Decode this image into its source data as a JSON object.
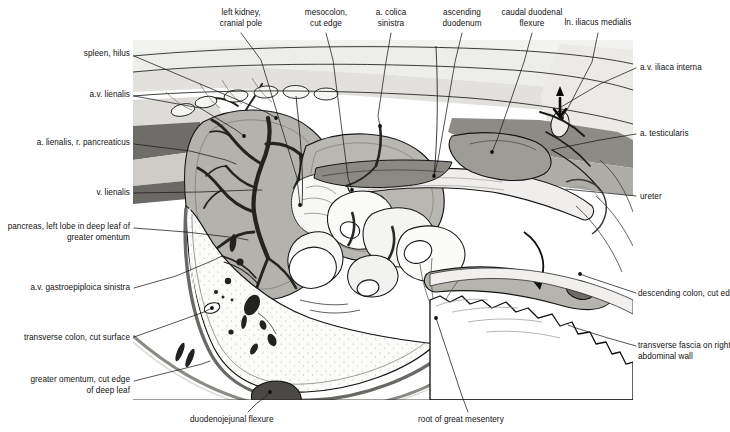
{
  "plate": {
    "title": "Abdominal cavity, left lateral view",
    "domain": "anatomical-illustration",
    "medium": "grayscale line-and-tone drawing",
    "canvas": {
      "width": 730,
      "height": 432
    },
    "artwork_frame": {
      "x": 133,
      "y": 40,
      "width": 500,
      "height": 360
    }
  },
  "palette": {
    "page_background": "#ffffff",
    "label_text": "#121212",
    "leader_line": "#1a1a1a",
    "outline": "#111111",
    "tone_lightest": "#f4f4f2",
    "tone_light": "#e6e5e2",
    "tone_mid_light": "#cfcdc9",
    "tone_mid": "#b2b0ab",
    "tone_mid_dark": "#8e8c87",
    "tone_dark": "#5d5b57",
    "tone_darkest": "#2e2d2b"
  },
  "labels": [
    {
      "id": "left-kidney-cranial-pole",
      "text": "left kidney,\ncranial pole",
      "align": "center",
      "x": 198,
      "y": 8,
      "width": 86,
      "leader": [
        [
          241,
          33
        ],
        [
          261,
          60
        ],
        [
          297,
          178
        ],
        [
          300,
          205
        ]
      ]
    },
    {
      "id": "mesocolon-cut-edge",
      "text": "mesocolon,\ncut edge",
      "align": "center",
      "x": 288,
      "y": 8,
      "width": 76,
      "leader": [
        [
          326,
          33
        ],
        [
          333,
          60
        ],
        [
          348,
          178
        ],
        [
          352,
          190
        ]
      ]
    },
    {
      "id": "a-colica-sinistra",
      "text": "a. colica\nsinistra",
      "align": "center",
      "x": 360,
      "y": 8,
      "width": 62,
      "leader": [
        [
          391,
          33
        ],
        [
          386,
          62
        ],
        [
          378,
          116
        ],
        [
          380,
          126
        ]
      ]
    },
    {
      "id": "ascending-duodenum",
      "text": "ascending\nduodenum",
      "align": "center",
      "x": 425,
      "y": 8,
      "width": 74,
      "leader": [
        [
          462,
          33
        ],
        [
          455,
          62
        ],
        [
          438,
          160
        ],
        [
          434,
          176
        ]
      ]
    },
    {
      "id": "caudal-duodenal-flexure",
      "text": "caudal duodenal\nflexure",
      "align": "center",
      "x": 480,
      "y": 8,
      "width": 104,
      "leader": [
        [
          532,
          33
        ],
        [
          524,
          62
        ],
        [
          497,
          140
        ],
        [
          492,
          152
        ]
      ]
    },
    {
      "id": "ln-iliacus-medialis",
      "text": "ln. iliacus medialis",
      "align": "center",
      "x": 548,
      "y": 18,
      "width": 100,
      "leader": [
        [
          598,
          33
        ],
        [
          592,
          62
        ],
        [
          568,
          108
        ],
        [
          562,
          118
        ]
      ]
    },
    {
      "id": "spleen-hilus",
      "text": "spleen, hilus",
      "align": "right",
      "x": 20,
      "y": 49,
      "width": 110,
      "leader": [
        [
          134,
          56
        ],
        [
          205,
          86
        ],
        [
          266,
          112
        ],
        [
          276,
          118
        ]
      ]
    },
    {
      "id": "a-v-lienalis",
      "text": "a.v. lienalis",
      "align": "right",
      "x": 20,
      "y": 90,
      "width": 110,
      "leader": [
        [
          134,
          96
        ],
        [
          200,
          108
        ],
        [
          236,
          130
        ],
        [
          244,
          136
        ]
      ]
    },
    {
      "id": "a-lienalis-r-pancreaticus",
      "text": "a. lienalis, r. pancreaticus",
      "align": "right",
      "x": 5,
      "y": 138,
      "width": 125,
      "leader": [
        [
          134,
          144
        ],
        [
          190,
          151
        ],
        [
          226,
          160
        ],
        [
          236,
          164
        ]
      ]
    },
    {
      "id": "v-lienalis",
      "text": "v. lienalis",
      "align": "right",
      "x": 20,
      "y": 188,
      "width": 110,
      "leader": [
        [
          134,
          193
        ],
        [
          200,
          192
        ],
        [
          252,
          190
        ],
        [
          262,
          190
        ]
      ]
    },
    {
      "id": "pancreas-left-lobe",
      "text": "pancreas, left lobe in deep leaf of\ngreater omentum",
      "align": "right",
      "x": 2,
      "y": 222,
      "width": 128,
      "leader": [
        [
          134,
          228
        ],
        [
          186,
          232
        ],
        [
          238,
          238
        ],
        [
          248,
          240
        ]
      ]
    },
    {
      "id": "a-v-gastroepiploica-sinistra",
      "text": "a.v. gastroepiploica sinistra",
      "align": "right",
      "x": 2,
      "y": 283,
      "width": 128,
      "leader": [
        [
          134,
          288
        ],
        [
          176,
          276
        ],
        [
          214,
          260
        ],
        [
          222,
          256
        ]
      ]
    },
    {
      "id": "transverse-colon-cut-surface",
      "text": "transverse colon, cut surface",
      "align": "right",
      "x": 0,
      "y": 333,
      "width": 130,
      "leader": [
        [
          134,
          337
        ],
        [
          168,
          325
        ],
        [
          204,
          312
        ],
        [
          212,
          308
        ]
      ]
    },
    {
      "id": "greater-omentum-cut-edge",
      "text": "greater omentum, cut edge\nof deep leaf",
      "align": "right",
      "x": 2,
      "y": 375,
      "width": 128,
      "leader": [
        [
          134,
          381
        ],
        [
          170,
          372
        ],
        [
          202,
          364
        ],
        [
          210,
          361
        ]
      ]
    },
    {
      "id": "a-v-iliaca-interna",
      "text": "a.v. iliaca interna",
      "align": "left",
      "x": 640,
      "y": 63,
      "width": 90,
      "leader": [
        [
          636,
          68
        ],
        [
          600,
          84
        ],
        [
          566,
          104
        ],
        [
          558,
          109
        ]
      ]
    },
    {
      "id": "a-testicularis",
      "text": "a. testicularis",
      "align": "left",
      "x": 640,
      "y": 129,
      "width": 90,
      "leader": [
        [
          636,
          134
        ],
        [
          600,
          140
        ],
        [
          560,
          148
        ],
        [
          552,
          150
        ]
      ]
    },
    {
      "id": "ureter",
      "text": "ureter",
      "align": "left",
      "x": 640,
      "y": 192,
      "width": 90,
      "leader": [
        [
          636,
          196
        ],
        [
          606,
          193
        ],
        [
          574,
          190
        ],
        [
          566,
          189
        ]
      ]
    },
    {
      "id": "descending-colon-cut-edge",
      "text": "descending colon, cut edge",
      "align": "left",
      "x": 638,
      "y": 289,
      "width": 92,
      "leader": [
        [
          636,
          293
        ],
        [
          612,
          285
        ],
        [
          588,
          277
        ],
        [
          580,
          274
        ]
      ]
    },
    {
      "id": "transverse-fascia-right-wall",
      "text": "transverse fascia on right\nabdominal wall",
      "align": "left",
      "x": 638,
      "y": 341,
      "width": 92,
      "leader": [
        [
          636,
          346
        ],
        [
          608,
          338
        ],
        [
          576,
          328
        ],
        [
          568,
          325
        ]
      ]
    },
    {
      "id": "duodenojejunal-flexure",
      "text": "duodenojejunal flexure",
      "align": "left",
      "x": 190,
      "y": 415,
      "width": 120,
      "leader": [
        [
          248,
          412
        ],
        [
          256,
          404
        ],
        [
          266,
          396
        ],
        [
          270,
          392
        ]
      ]
    },
    {
      "id": "root-of-great-mesentery",
      "text": "root of great mesentery",
      "align": "left",
      "x": 418,
      "y": 415,
      "width": 124,
      "leader": [
        [
          468,
          412
        ],
        [
          462,
          396
        ],
        [
          440,
          330
        ],
        [
          436,
          318
        ]
      ]
    }
  ],
  "anchor_dots": [
    {
      "id": "dot-kidney",
      "x": 300,
      "y": 205
    },
    {
      "id": "dot-mesocolon",
      "x": 352,
      "y": 190
    },
    {
      "id": "dot-colica",
      "x": 380,
      "y": 126
    },
    {
      "id": "dot-ascending-duodenum",
      "x": 434,
      "y": 176
    },
    {
      "id": "dot-caudal-flexure",
      "x": 492,
      "y": 152
    },
    {
      "id": "dot-ln-iliacus",
      "x": 562,
      "y": 118
    },
    {
      "id": "dot-spleen-hilus",
      "x": 276,
      "y": 118
    },
    {
      "id": "dot-av-lienalis",
      "x": 244,
      "y": 136
    },
    {
      "id": "dot-colon-cut",
      "x": 212,
      "y": 308
    },
    {
      "id": "dot-duodenojejunal",
      "x": 270,
      "y": 392
    },
    {
      "id": "dot-root-mesentery",
      "x": 436,
      "y": 318
    },
    {
      "id": "dot-descending-colon",
      "x": 580,
      "y": 274
    }
  ],
  "figure_regions": [
    {
      "id": "dorsal-body-wall",
      "tone": "tone_light",
      "note": "upper band running across the top of the plate"
    },
    {
      "id": "spleen",
      "tone": "tone_mid",
      "note": "large oval organ, left of centre, bearing the hilar vessels"
    },
    {
      "id": "splenic-vessels",
      "tone": "tone_darkest",
      "note": "branching dark vascular tree on the spleen"
    },
    {
      "id": "pancreas-left-lobe",
      "tone": "tone_lightest",
      "note": "lobulated pale mass adjoining the spleen"
    },
    {
      "id": "jejunal-loops",
      "tone": "tone_lightest",
      "note": "coils of small intestine across the centre"
    },
    {
      "id": "descending-duodenum",
      "tone": "tone_mid_light",
      "note": "long tube running caudally to the right"
    },
    {
      "id": "mesocolon-cut-edge",
      "tone": "tone_mid_dark",
      "note": "dark mesenteric sheet above the gut coils"
    },
    {
      "id": "left-kidney",
      "tone": "tone_mid",
      "note": "rounded mass, dorsal, right of the spleen"
    },
    {
      "id": "greater-omentum-deep-leaf",
      "tone": "tone_lightest",
      "note": "broad translucent sheet, lower left, with fat flecks"
    },
    {
      "id": "transverse-fascia",
      "tone": "tone_lightest",
      "note": "torn jagged-edged sheet, lower right"
    },
    {
      "id": "flow-arrow",
      "tone": "outline",
      "note": "curved arrow indicating course of the descending colon"
    }
  ]
}
